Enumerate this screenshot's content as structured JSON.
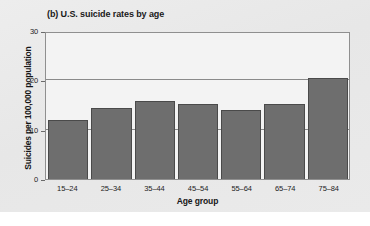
{
  "chart_data": {
    "type": "bar",
    "title": "(b) U.S. suicide rates by age",
    "xlabel": "Age group",
    "ylabel": "Suicides per 100,000 population",
    "categories": [
      "15–24",
      "25–34",
      "35–44",
      "45–54",
      "55–64",
      "65–74",
      "75–84"
    ],
    "values": [
      12.0,
      14.3,
      15.8,
      15.2,
      13.9,
      15.3,
      20.4
    ],
    "ylim": [
      0,
      30
    ],
    "yticks": [
      "0",
      "10",
      "20",
      "30"
    ],
    "ytick_values": [
      0,
      10,
      20,
      30
    ],
    "grid": "horizontal",
    "legend": "none",
    "bar_color": "#6e6e6e",
    "bar_edge_color": "#4a4a4a",
    "plot_background": "#f3f3f3",
    "card_background": "#e9e9e9",
    "axis_color": "#8f8f8f"
  }
}
